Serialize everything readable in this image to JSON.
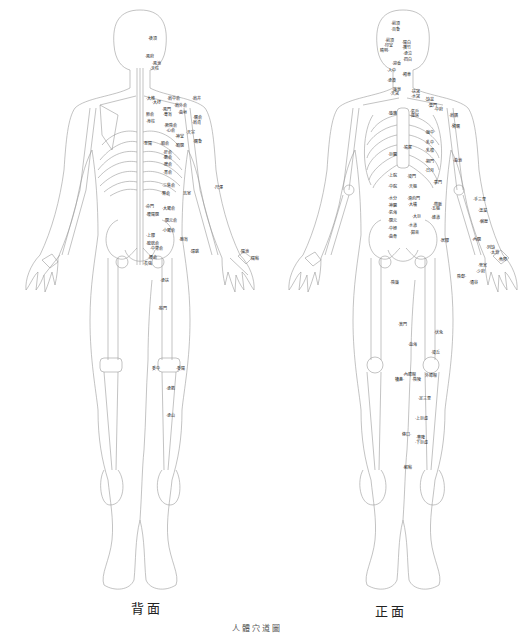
{
  "figure": {
    "title": "人體穴道圖",
    "colors": {
      "line": "#9a9a9a",
      "text": "#222222",
      "background": "#ffffff"
    },
    "back": {
      "caption": "背面",
      "points": [
        {
          "label": "·後頂",
          "x": 148,
          "y": 36
        },
        {
          "label": "·風府",
          "x": 145,
          "y": 54
        },
        {
          "label": "·風池",
          "x": 152,
          "y": 61
        },
        {
          "label": "·天柱",
          "x": 150,
          "y": 66
        },
        {
          "label": "·大椎",
          "x": 146,
          "y": 96
        },
        {
          "label": "·肩中俞",
          "x": 167,
          "y": 96
        },
        {
          "label": "·肩井",
          "x": 192,
          "y": 96
        },
        {
          "label": "·大杼",
          "x": 152,
          "y": 100
        },
        {
          "label": "·肩外俞",
          "x": 174,
          "y": 103
        },
        {
          "label": "·風門",
          "x": 162,
          "y": 107
        },
        {
          "label": "·曲垣",
          "x": 178,
          "y": 110
        },
        {
          "label": "肺俞",
          "x": 146,
          "y": 112
        },
        {
          "label": "·膏肓",
          "x": 163,
          "y": 112
        },
        {
          "label": "·臑俞",
          "x": 193,
          "y": 115
        },
        {
          "label": "·身柱",
          "x": 146,
          "y": 119
        },
        {
          "label": "·肩貞",
          "x": 192,
          "y": 120
        },
        {
          "label": "·厥陰俞",
          "x": 164,
          "y": 123
        },
        {
          "label": "·心俞",
          "x": 166,
          "y": 128
        },
        {
          "label": "·天宗",
          "x": 186,
          "y": 130
        },
        {
          "label": "·神堂",
          "x": 175,
          "y": 134
        },
        {
          "label": "·至陽",
          "x": 143,
          "y": 141
        },
        {
          "label": "·膈俞",
          "x": 160,
          "y": 141
        },
        {
          "label": "·膈關",
          "x": 175,
          "y": 143
        },
        {
          "label": "·臑會",
          "x": 193,
          "y": 139
        },
        {
          "label": "·肝俞",
          "x": 163,
          "y": 150
        },
        {
          "label": "·膽俞",
          "x": 163,
          "y": 155
        },
        {
          "label": "·脾俞",
          "x": 163,
          "y": 162
        },
        {
          "label": "·胃俞",
          "x": 163,
          "y": 170
        },
        {
          "label": "·三焦俞",
          "x": 162,
          "y": 183
        },
        {
          "label": "·腎俞",
          "x": 161,
          "y": 191
        },
        {
          "label": "志室",
          "x": 183,
          "y": 191
        },
        {
          "label": "·尺澤",
          "x": 214,
          "y": 185
        },
        {
          "label": "·命門",
          "x": 145,
          "y": 204
        },
        {
          "label": "·大腸俞",
          "x": 162,
          "y": 206
        },
        {
          "label": "·腰陽關",
          "x": 146,
          "y": 212
        },
        {
          "label": "·關元俞",
          "x": 164,
          "y": 218
        },
        {
          "label": "·小腸俞",
          "x": 162,
          "y": 228
        },
        {
          "label": "·上髎",
          "x": 146,
          "y": 233
        },
        {
          "label": "·胞肓",
          "x": 179,
          "y": 237
        },
        {
          "label": "·膀胱俞",
          "x": 146,
          "y": 241
        },
        {
          "label": "·中膂俞",
          "x": 150,
          "y": 246
        },
        {
          "label": "·環跳",
          "x": 190,
          "y": 249
        },
        {
          "label": "·陽池",
          "x": 240,
          "y": 249
        },
        {
          "label": "·腰俞",
          "x": 148,
          "y": 255
        },
        {
          "label": "·陽谿",
          "x": 250,
          "y": 256
        },
        {
          "label": "·長強",
          "x": 143,
          "y": 261
        },
        {
          "label": "·承扶",
          "x": 160,
          "y": 278
        },
        {
          "label": "·殷門",
          "x": 158,
          "y": 306
        },
        {
          "label": "委中",
          "x": 152,
          "y": 366
        },
        {
          "label": "·委陽",
          "x": 176,
          "y": 366
        },
        {
          "label": "·承筋",
          "x": 166,
          "y": 386
        },
        {
          "label": "·承山",
          "x": 166,
          "y": 413
        }
      ]
    },
    "front": {
      "caption": "正面",
      "points": [
        {
          "label": "·前頂",
          "x": 391,
          "y": 21
        },
        {
          "label": "·百會",
          "x": 391,
          "y": 27
        },
        {
          "label": "·前頂",
          "x": 385,
          "y": 38
        },
        {
          "label": "·印堂",
          "x": 384,
          "y": 43
        },
        {
          "label": "睛明·",
          "x": 380,
          "y": 48
        },
        {
          "label": "·陽白",
          "x": 402,
          "y": 40
        },
        {
          "label": "·攢竹",
          "x": 402,
          "y": 45
        },
        {
          "label": "·承泣",
          "x": 403,
          "y": 51
        },
        {
          "label": "·四白",
          "x": 403,
          "y": 57
        },
        {
          "label": "·迎香",
          "x": 392,
          "y": 61
        },
        {
          "label": "·人中",
          "x": 387,
          "y": 68
        },
        {
          "label": "·頰車",
          "x": 402,
          "y": 72
        },
        {
          "label": "·承漿",
          "x": 387,
          "y": 78
        },
        {
          "label": "·廉泉",
          "x": 392,
          "y": 87
        },
        {
          "label": "·天突",
          "x": 390,
          "y": 91
        },
        {
          "label": "·扶突",
          "x": 411,
          "y": 89
        },
        {
          "label": "·水突",
          "x": 411,
          "y": 94
        },
        {
          "label": "·缺盆",
          "x": 425,
          "y": 97
        },
        {
          "label": "·雲門",
          "x": 428,
          "y": 103
        },
        {
          "label": "·中府",
          "x": 434,
          "y": 107
        },
        {
          "label": "·璇璣",
          "x": 388,
          "y": 111
        },
        {
          "label": "·氣戶",
          "x": 410,
          "y": 109
        },
        {
          "label": "·庫房",
          "x": 410,
          "y": 113
        },
        {
          "label": "·肩髃",
          "x": 449,
          "y": 113
        },
        {
          "label": "·臂臑",
          "x": 451,
          "y": 124
        },
        {
          "label": "·膻中",
          "x": 425,
          "y": 130
        },
        {
          "label": "·乳中",
          "x": 425,
          "y": 140
        },
        {
          "label": "·乳根",
          "x": 425,
          "y": 148
        },
        {
          "label": "·鳩尾",
          "x": 403,
          "y": 145
        },
        {
          "label": "·巨闕",
          "x": 388,
          "y": 152
        },
        {
          "label": "·期門",
          "x": 425,
          "y": 159
        },
        {
          "label": "·曲池",
          "x": 453,
          "y": 158
        },
        {
          "label": "·日月",
          "x": 425,
          "y": 168
        },
        {
          "label": "·上脘",
          "x": 388,
          "y": 173
        },
        {
          "label": "·梁門",
          "x": 407,
          "y": 174
        },
        {
          "label": "·章門",
          "x": 433,
          "y": 180
        },
        {
          "label": "·中脘",
          "x": 388,
          "y": 184
        },
        {
          "label": "·天樞",
          "x": 408,
          "y": 184
        },
        {
          "label": "·手三里",
          "x": 473,
          "y": 197
        },
        {
          "label": "·水分",
          "x": 388,
          "y": 196
        },
        {
          "label": "·滑肉門",
          "x": 407,
          "y": 196
        },
        {
          "label": "·帶脈",
          "x": 433,
          "y": 202
        },
        {
          "label": "·神闕",
          "x": 388,
          "y": 203
        },
        {
          "label": "·大橫",
          "x": 408,
          "y": 202
        },
        {
          "label": "·溫溜",
          "x": 478,
          "y": 208
        },
        {
          "label": "·氣海",
          "x": 388,
          "y": 210
        },
        {
          "label": "·五樞",
          "x": 431,
          "y": 206
        },
        {
          "label": "·大巨",
          "x": 412,
          "y": 214
        },
        {
          "label": "·關元",
          "x": 388,
          "y": 218
        },
        {
          "label": "·維道",
          "x": 431,
          "y": 215
        },
        {
          "label": "·偏歷",
          "x": 479,
          "y": 219
        },
        {
          "label": "·中極",
          "x": 388,
          "y": 226
        },
        {
          "label": "·水道",
          "x": 408,
          "y": 223
        },
        {
          "label": "·歸來",
          "x": 410,
          "y": 230
        },
        {
          "label": "·內關",
          "x": 472,
          "y": 237
        },
        {
          "label": "·曲骨",
          "x": 388,
          "y": 234
        },
        {
          "label": "·居髎",
          "x": 440,
          "y": 238
        },
        {
          "label": "·列缺",
          "x": 486,
          "y": 245
        },
        {
          "label": "·太淵",
          "x": 490,
          "y": 250
        },
        {
          "label": "·魚際",
          "x": 498,
          "y": 257
        },
        {
          "label": "·勞宮",
          "x": 478,
          "y": 263
        },
        {
          "label": "·少府",
          "x": 476,
          "y": 269
        },
        {
          "label": "陰郄·",
          "x": 457,
          "y": 274
        },
        {
          "label": "·通谷",
          "x": 469,
          "y": 280
        },
        {
          "label": "·陰廉",
          "x": 390,
          "y": 280
        },
        {
          "label": "·箕門",
          "x": 398,
          "y": 322
        },
        {
          "label": "·伏兔",
          "x": 434,
          "y": 330
        },
        {
          "label": "·血海",
          "x": 408,
          "y": 342
        },
        {
          "label": "·梁丘",
          "x": 431,
          "y": 350
        },
        {
          "label": "·內膝眼",
          "x": 403,
          "y": 372
        },
        {
          "label": "外膝眼",
          "x": 425,
          "y": 373
        },
        {
          "label": "犢鼻·",
          "x": 395,
          "y": 377
        },
        {
          "label": "·陰陵",
          "x": 412,
          "y": 377
        },
        {
          "label": "·足三里",
          "x": 418,
          "y": 396
        },
        {
          "label": "·上巨虛",
          "x": 415,
          "y": 416
        },
        {
          "label": "條口·",
          "x": 402,
          "y": 432
        },
        {
          "label": "·豐隆",
          "x": 416,
          "y": 435
        },
        {
          "label": "·下巨虛",
          "x": 415,
          "y": 440
        },
        {
          "label": "·解谿",
          "x": 403,
          "y": 465
        }
      ]
    }
  }
}
